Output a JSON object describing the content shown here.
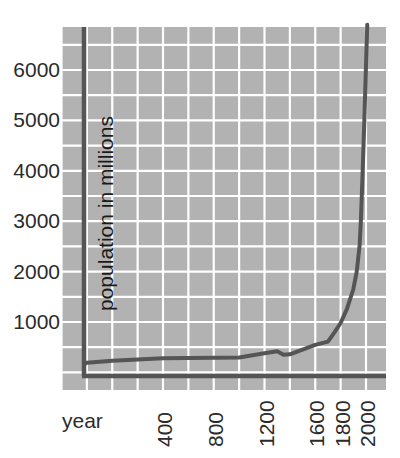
{
  "chart_data": {
    "type": "line",
    "title": "",
    "subtitle": "",
    "xlabel": "year",
    "ylabel": "population in millions",
    "xlim": [
      -400,
      2050
    ],
    "ylim": [
      0,
      6800
    ],
    "xticks": [
      400,
      800,
      1200,
      1600,
      1800,
      2000
    ],
    "xtick_labels": [
      "400",
      "800",
      "1200",
      "1600",
      "1800",
      "2000"
    ],
    "yticks": [
      1000,
      2000,
      3000,
      4000,
      5000,
      6000
    ],
    "ytick_labels": [
      "1000",
      "2000",
      "3000",
      "4000",
      "5000",
      "6000"
    ],
    "grid": true,
    "grid_color": "#ffffff",
    "panel_color": "#b2b2b2",
    "line_color": "#555555",
    "legend": null,
    "legend_position": "none",
    "annotations": [],
    "series": [
      {
        "name": "world population",
        "x": [
          -400,
          -200,
          0,
          200,
          400,
          600,
          800,
          1000,
          1200,
          1300,
          1350,
          1400,
          1500,
          1600,
          1700,
          1750,
          1800,
          1850,
          1900,
          1927,
          1950,
          1960,
          1974,
          1987,
          1999,
          2000,
          2005,
          2010
        ],
        "values": [
          162,
          190,
          230,
          257,
          280,
          285,
          290,
          295,
          380,
          420,
          350,
          360,
          450,
          545,
          610,
          790,
          980,
          1260,
          1650,
          2000,
          2530,
          3030,
          4000,
          5000,
          6000,
          6100,
          6500,
          6900
        ]
      }
    ]
  },
  "axis": {
    "y_axis_line_color": "#555555",
    "x_axis_line_color": "#555555"
  }
}
